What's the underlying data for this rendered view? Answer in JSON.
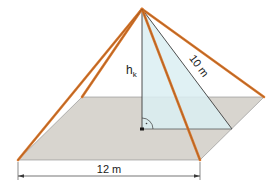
{
  "diagram": {
    "type": "square pyramid",
    "labels": {
      "height_label": "h",
      "height_subscript": "k",
      "slant_label": "10 m",
      "base_label": "12 m"
    },
    "colors": {
      "edges": "#d9782d",
      "base": "#d8d5cf",
      "triangle": "#dbeef2",
      "lines": "#3a3a3a"
    },
    "annotations": {
      "right_angle": "·"
    }
  }
}
